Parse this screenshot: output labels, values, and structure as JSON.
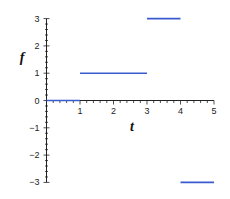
{
  "chart_data": {
    "type": "line",
    "title": "",
    "xlabel": "t",
    "ylabel": "f",
    "xlim": [
      0,
      5
    ],
    "ylim": [
      -3,
      3
    ],
    "x_ticks": [
      "1",
      "2",
      "3",
      "4",
      "5"
    ],
    "y_ticks": [
      "3",
      "2",
      "1",
      "0",
      "-1",
      "-2",
      "-3"
    ],
    "grid": false,
    "legend": null,
    "series": [
      {
        "name": "f(t)",
        "style": "piecewise-constant",
        "color": "#3a5bd0",
        "segments": [
          {
            "x_start": 0,
            "x_end": 1,
            "y": 0
          },
          {
            "x_start": 1,
            "x_end": 3,
            "y": 1
          },
          {
            "x_start": 3,
            "x_end": 4,
            "y": 3
          },
          {
            "x_start": 4,
            "x_end": 5,
            "y": -3
          }
        ]
      }
    ]
  },
  "labels": {
    "x_axis": "t",
    "y_axis": "f"
  },
  "colors": {
    "series": "#3a5bd0",
    "axis": "#222222"
  }
}
